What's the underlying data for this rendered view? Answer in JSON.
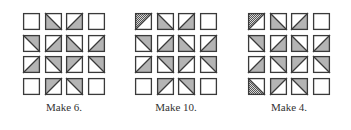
{
  "colors": {
    "outline": "#3a3a3a",
    "fill": "#b4b4b4",
    "hatch_dark": "#555555",
    "hatch_light": "#d8d8d8",
    "background": "#ffffff"
  },
  "legend": {
    "E": "empty square",
    "BL": "\\ diagonal, bottom-left shaded",
    "TR": "\\ diagonal, top-right shaded",
    "TL": "/ diagonal, top-left shaded",
    "BR": "/ diagonal, bottom-right shaded",
    "TLh": "/ diagonal, top-left hatched (dark)",
    "BLh": "\\ diagonal, bottom-left hatched (dark)"
  },
  "panels": [
    {
      "caption": "Make 6.",
      "grid": [
        [
          "E",
          "BL",
          "BR",
          "E"
        ],
        [
          "TR",
          "BR",
          "BL",
          "BR"
        ],
        [
          "BR",
          "TR",
          "TL",
          "TR"
        ],
        [
          "E",
          "TL",
          "TR",
          "E"
        ]
      ]
    },
    {
      "caption": "Make 10.",
      "grid": [
        [
          "TLh",
          "BL",
          "BR",
          "E"
        ],
        [
          "TR",
          "BR",
          "BL",
          "BR"
        ],
        [
          "BR",
          "TR",
          "TL",
          "TR"
        ],
        [
          "E",
          "TL",
          "TR",
          "E"
        ]
      ]
    },
    {
      "caption": "Make 4.",
      "grid": [
        [
          "TLh",
          "BL",
          "BR",
          "E"
        ],
        [
          "TR",
          "BR",
          "BL",
          "BR"
        ],
        [
          "BR",
          "TR",
          "TL",
          "TR"
        ],
        [
          "BLh",
          "TL",
          "TR",
          "E"
        ]
      ]
    }
  ]
}
